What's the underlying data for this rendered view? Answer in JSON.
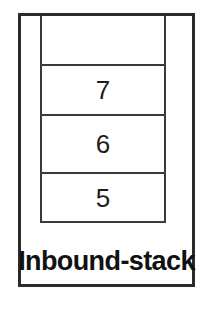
{
  "diagram": {
    "label": "Inbound-stack",
    "border_color": "#2b2b2b",
    "line_color": "#3a3a3a",
    "background_color": "#ffffff",
    "text_color": "#111111",
    "stack": {
      "orientation": "vertical",
      "open_end": "top",
      "capacity": 4,
      "slots": [
        {
          "value": "",
          "occupied": false
        },
        {
          "value": "7",
          "occupied": true
        },
        {
          "value": "6",
          "occupied": true
        },
        {
          "value": "5",
          "occupied": true
        }
      ]
    }
  }
}
